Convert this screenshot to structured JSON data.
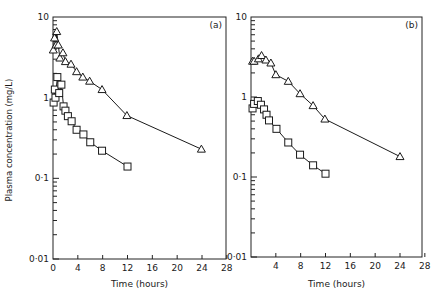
{
  "chart_data": [
    {
      "type": "line",
      "panel_label": "(a)",
      "xlabel": "Time (hours)",
      "ylabel": "Plasma concentration (mg/L)",
      "yscale": "log",
      "xlim": [
        0,
        28
      ],
      "ylim": [
        0.01,
        10
      ],
      "xticks": [
        0,
        4,
        8,
        12,
        16,
        20,
        24,
        28
      ],
      "xtick_labels": [
        "0",
        "4",
        "8",
        "12",
        "16",
        "20",
        "24",
        "28"
      ],
      "yticks": [
        0.01,
        0.1,
        1,
        10
      ],
      "ytick_labels": [
        "0·01",
        "0·1",
        "1",
        "10"
      ],
      "grid": false,
      "series": [
        {
          "name": "triangles",
          "marker": "triangle",
          "x": [
            0.05,
            0.25,
            0.5,
            0.6,
            0.85,
            1.1,
            1.6,
            2.0,
            2.9,
            3.8,
            4.8,
            5.9,
            7.9,
            11.9,
            23.9
          ],
          "y": [
            3.9,
            5.5,
            4.5,
            6.6,
            4.5,
            3.1,
            3.6,
            2.8,
            2.6,
            2.1,
            1.8,
            1.6,
            1.26,
            0.6,
            0.23
          ]
        },
        {
          "name": "squares",
          "marker": "square",
          "x": [
            0.1,
            0.3,
            0.4,
            0.7,
            1.0,
            1.35,
            1.7,
            2.0,
            2.4,
            3.0,
            3.8,
            4.9,
            6.0,
            7.9,
            12.0
          ],
          "y": [
            0.87,
            1.26,
            1.0,
            1.8,
            1.14,
            1.45,
            0.78,
            0.69,
            0.59,
            0.51,
            0.4,
            0.35,
            0.28,
            0.22,
            0.14
          ]
        }
      ]
    },
    {
      "type": "line",
      "panel_label": "(b)",
      "xlabel": "Time (hours)",
      "ylabel": "",
      "yscale": "log",
      "xlim": [
        0,
        28
      ],
      "ylim": [
        0.01,
        10
      ],
      "xticks": [
        4,
        8,
        12,
        16,
        20,
        24,
        28
      ],
      "xtick_labels": [
        "4",
        "8",
        "12",
        "16",
        "20",
        "24",
        "28"
      ],
      "yticks": [
        0.01,
        0.1,
        1,
        10
      ],
      "ytick_labels": [
        "0·01",
        "0·1",
        "1",
        "10"
      ],
      "grid": false,
      "series": [
        {
          "name": "triangles",
          "marker": "triangle",
          "x": [
            0.25,
            0.5,
            1.2,
            1.7,
            2.4,
            3.2,
            4.0,
            6.0,
            7.9,
            10.0,
            11.9,
            24.0
          ],
          "y": [
            2.8,
            2.8,
            3.0,
            3.3,
            2.9,
            2.66,
            1.9,
            1.57,
            1.1,
            0.78,
            0.53,
            0.18
          ]
        },
        {
          "name": "squares",
          "marker": "square",
          "x": [
            0.25,
            0.5,
            1.1,
            1.6,
            2.1,
            2.5,
            2.9,
            4.1,
            6.0,
            7.9,
            10.0,
            12.0
          ],
          "y": [
            0.72,
            0.82,
            0.89,
            0.8,
            0.7,
            0.6,
            0.51,
            0.4,
            0.27,
            0.19,
            0.14,
            0.11
          ]
        }
      ]
    }
  ]
}
